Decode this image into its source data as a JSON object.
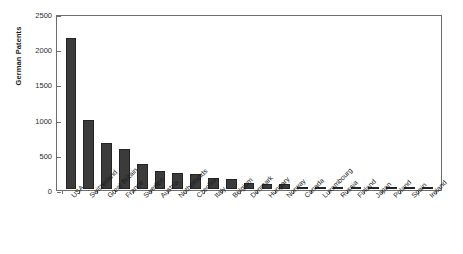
{
  "chart_data": {
    "type": "bar",
    "title": "",
    "subtitle": "",
    "xlabel": "",
    "ylabel": "German Patents",
    "ylim": [
      0,
      2500
    ],
    "yticks": [
      0,
      500,
      1000,
      1500,
      2000,
      2500
    ],
    "ytick_labels": [
      "0",
      "500",
      "1000",
      "1500",
      "2000",
      "2500"
    ],
    "grid": false,
    "legend": null,
    "legend_position": "none",
    "bar_color": "#3b3b3b",
    "axis_color": "#6e6e6e",
    "background_color": "#ffffff",
    "categories": [
      "USA",
      "Switzerland",
      "Great Britain",
      "France",
      "Sweden",
      "Austria",
      "Netherlands",
      "Czechia",
      "Italy",
      "Belgium",
      "Denmark",
      "Hungary",
      "Norway",
      "Canada",
      "Luxembourg",
      "Russia",
      "Finland",
      "Japan",
      "Poland",
      "Spain",
      "Ireland"
    ],
    "values": [
      2190,
      1000,
      665,
      580,
      360,
      260,
      240,
      225,
      165,
      140,
      85,
      75,
      75,
      25,
      20,
      18,
      15,
      15,
      12,
      12,
      5
    ]
  }
}
